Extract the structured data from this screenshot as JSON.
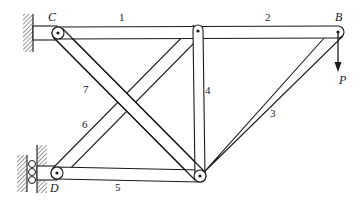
{
  "diagram": {
    "type": "truss",
    "joints": [
      {
        "id": "C",
        "label": "C",
        "x": 58,
        "y": 33,
        "support": "fixed-wall"
      },
      {
        "id": "B",
        "label": "B",
        "x": 338,
        "y": 32,
        "support": "none"
      },
      {
        "id": "T",
        "label": "",
        "x": 198,
        "y": 30,
        "support": "none"
      },
      {
        "id": "D",
        "label": "D",
        "x": 57,
        "y": 173,
        "support": "roller-wall"
      },
      {
        "id": "E",
        "label": "",
        "x": 200,
        "y": 176,
        "support": "none"
      }
    ],
    "members": [
      {
        "id": "1",
        "label": "1",
        "from": "C",
        "to": "T"
      },
      {
        "id": "2",
        "label": "2",
        "from": "T",
        "to": "B"
      },
      {
        "id": "3",
        "label": "3",
        "from": "B",
        "to": "E"
      },
      {
        "id": "4",
        "label": "4",
        "from": "T",
        "to": "E"
      },
      {
        "id": "5",
        "label": "5",
        "from": "D",
        "to": "E"
      },
      {
        "id": "6",
        "label": "6",
        "from": "D",
        "to": "T"
      },
      {
        "id": "7",
        "label": "7",
        "from": "C",
        "to": "E"
      }
    ],
    "load": {
      "label": "P",
      "at": "B",
      "direction": "down"
    },
    "labels": {
      "joint_c": "C",
      "joint_b": "B",
      "joint_d": "D",
      "load_p": "P",
      "member_1": "1",
      "member_2": "2",
      "member_3": "3",
      "member_4": "4",
      "member_5": "5",
      "member_6": "6",
      "member_7": "7"
    }
  }
}
